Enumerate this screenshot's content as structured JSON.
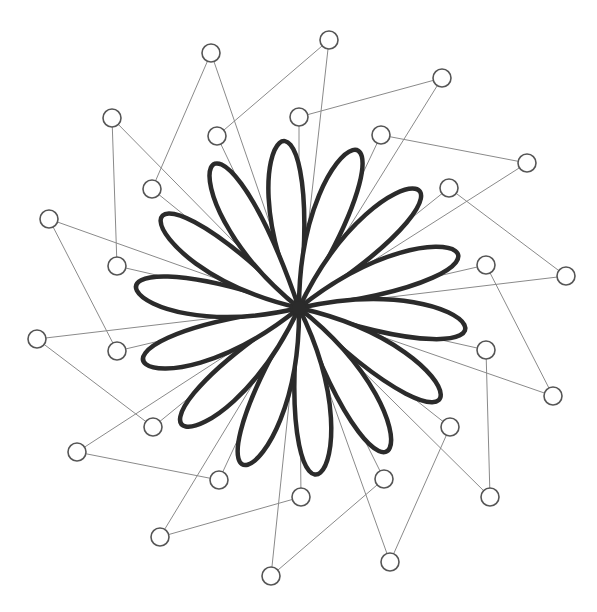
{
  "diagram": {
    "type": "bezier-rose",
    "center": {
      "x": 299,
      "y": 308
    },
    "petal_count": 14,
    "colors": {
      "petal_stroke": "#2b2b2b",
      "guide": "#8a8a8a",
      "handle_stroke": "#555555",
      "background": "#ffffff"
    },
    "outer_handles": [
      {
        "x": 329,
        "y": 40
      },
      {
        "x": 442,
        "y": 78
      },
      {
        "x": 527,
        "y": 163
      },
      {
        "x": 566,
        "y": 276
      },
      {
        "x": 553,
        "y": 396
      },
      {
        "x": 490,
        "y": 497
      },
      {
        "x": 390,
        "y": 562
      },
      {
        "x": 271,
        "y": 576
      },
      {
        "x": 160,
        "y": 537
      },
      {
        "x": 77,
        "y": 452
      },
      {
        "x": 37,
        "y": 339
      },
      {
        "x": 49,
        "y": 219
      },
      {
        "x": 112,
        "y": 118
      },
      {
        "x": 211,
        "y": 53
      }
    ],
    "inner_handles": [
      {
        "x": 381,
        "y": 135
      },
      {
        "x": 449,
        "y": 188
      },
      {
        "x": 486,
        "y": 265
      },
      {
        "x": 486,
        "y": 350
      },
      {
        "x": 450,
        "y": 427
      },
      {
        "x": 384,
        "y": 479
      },
      {
        "x": 301,
        "y": 497
      },
      {
        "x": 219,
        "y": 480
      },
      {
        "x": 153,
        "y": 427
      },
      {
        "x": 117,
        "y": 351
      },
      {
        "x": 117,
        "y": 266
      },
      {
        "x": 152,
        "y": 189
      },
      {
        "x": 217,
        "y": 136
      },
      {
        "x": 299,
        "y": 117
      }
    ]
  }
}
